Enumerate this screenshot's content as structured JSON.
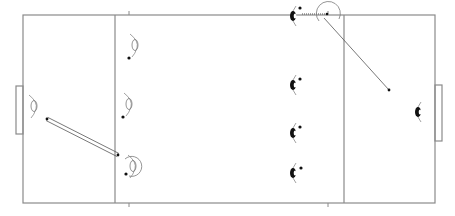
{
  "diagram": {
    "type": "hockey-field-drill",
    "colors": {
      "line": "#8a8a8a",
      "player_outline": "#7a7a7a",
      "player_filled": "#111111",
      "ball": "#111111",
      "pass": "#555555"
    },
    "field": {
      "x": 23,
      "y": 15,
      "w": 412,
      "h": 188
    },
    "zone_lines_x": [
      115,
      344
    ],
    "ticks_x": [
      129,
      328
    ],
    "goals": [
      {
        "side": "left",
        "x": 16,
        "y": 86,
        "w": 7,
        "h": 48
      },
      {
        "side": "right",
        "x": 435,
        "y": 85,
        "w": 7,
        "h": 56
      }
    ],
    "players_outline": [
      {
        "id": "o1",
        "x": 135,
        "y": 45,
        "ball": [
          129,
          58
        ]
      },
      {
        "id": "o2",
        "x": 129,
        "y": 104,
        "ball": [
          123,
          117
        ]
      },
      {
        "id": "o3",
        "x": 133,
        "y": 166,
        "ball": [
          126,
          174
        ],
        "circle": true
      },
      {
        "id": "o4",
        "x": 34,
        "y": 106
      }
    ],
    "players_filled": [
      {
        "id": "f1",
        "x": 293,
        "y": 16,
        "ball": [
          300,
          8
        ]
      },
      {
        "id": "f2",
        "x": 293,
        "y": 85,
        "ball": [
          300,
          79
        ]
      },
      {
        "id": "f3",
        "x": 293,
        "y": 133,
        "ball": [
          300,
          127
        ]
      },
      {
        "id": "f4",
        "x": 293,
        "y": 173,
        "ball": [
          301,
          168
        ]
      },
      {
        "id": "f5",
        "x": 418,
        "y": 112
      }
    ],
    "passes": [
      {
        "from": [
          47,
          119
        ],
        "to": [
          118,
          155
        ],
        "style": "double"
      },
      {
        "from": [
          302,
          14
        ],
        "to": [
          327,
          14
        ],
        "style": "dotted"
      },
      {
        "from": [
          324,
          18
        ],
        "to": [
          389,
          90
        ],
        "style": "solid"
      }
    ],
    "receiver_circle": {
      "x": 328,
      "y": 13,
      "r": 12
    }
  }
}
